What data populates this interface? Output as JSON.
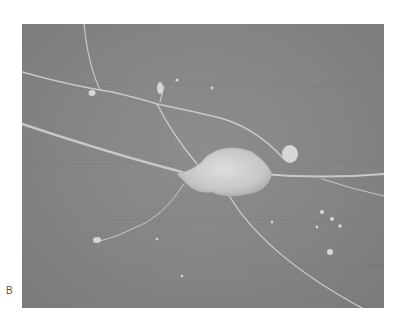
{
  "figure": {
    "panel_label": "B",
    "colors": {
      "background": "#ffffff",
      "substrate": "#858585",
      "cell": "#cfcfcf",
      "label": "#555555"
    }
  }
}
